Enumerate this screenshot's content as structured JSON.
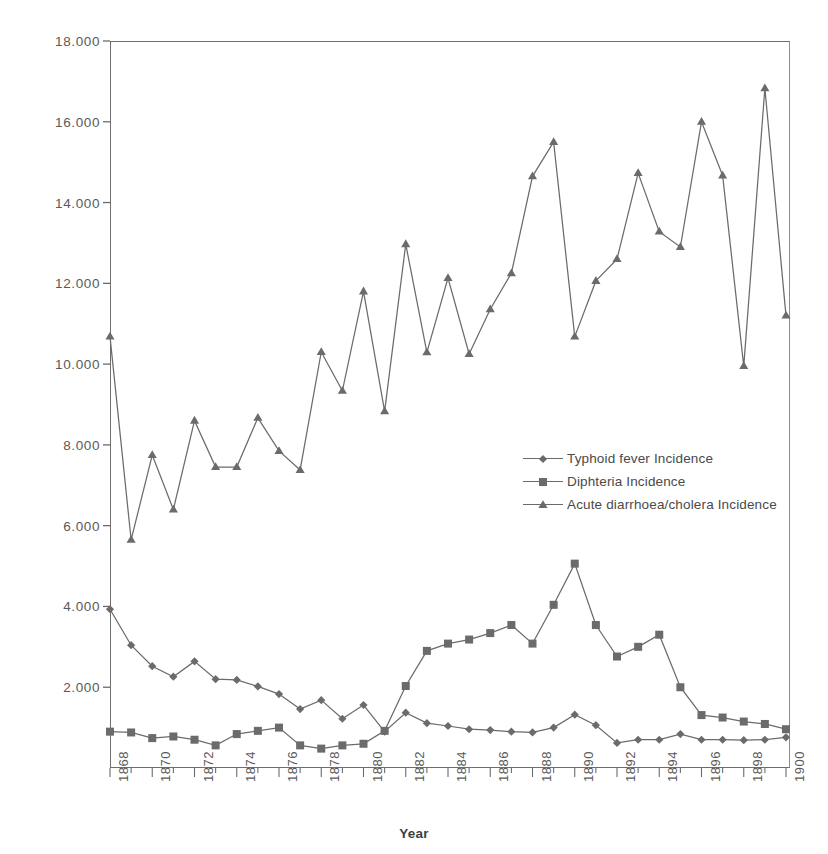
{
  "chart_data": {
    "type": "line",
    "title": "",
    "xlabel": "Year",
    "ylabel": "",
    "grid": false,
    "legend_position": "inside-center-right",
    "xlim": [
      1868,
      1900
    ],
    "ylim": [
      0,
      18000
    ],
    "y_tick_values": [
      18000,
      16000,
      14000,
      12000,
      10000,
      8000,
      6000,
      4000,
      2000
    ],
    "y_tick_labels": [
      "18.000",
      "16.000",
      "14.000",
      "12.000",
      "10.000",
      "8.000",
      "6.000",
      "4.000",
      "2.000"
    ],
    "x": [
      1868,
      1869,
      1870,
      1871,
      1872,
      1873,
      1874,
      1875,
      1876,
      1877,
      1878,
      1879,
      1880,
      1881,
      1882,
      1883,
      1884,
      1885,
      1886,
      1887,
      1888,
      1889,
      1890,
      1891,
      1892,
      1893,
      1894,
      1895,
      1896,
      1897,
      1898,
      1899,
      1900
    ],
    "x_tick_labels": [
      "1868",
      "",
      "1870",
      "",
      "1872",
      "",
      "1874",
      "",
      "1876",
      "",
      "1878",
      "",
      "1880",
      "",
      "1882",
      "",
      "1884",
      "",
      "1886",
      "",
      "1888",
      "",
      "1890",
      "",
      "1892",
      "",
      "1894",
      "",
      "1896",
      "",
      "1898",
      "",
      "1900"
    ],
    "series": [
      {
        "name": "Typhoid fever Incidence",
        "marker": "diamond",
        "color": "#6b6b6b",
        "values": [
          3930,
          3040,
          2520,
          2260,
          2640,
          2200,
          2180,
          2020,
          1830,
          1460,
          1680,
          1220,
          1560,
          900,
          1370,
          1110,
          1040,
          960,
          940,
          900,
          880,
          1000,
          1320,
          1060,
          620,
          700,
          700,
          840,
          700,
          700,
          690,
          700,
          760
        ]
      },
      {
        "name": "Diphteria Incidence",
        "marker": "square",
        "color": "#6b6b6b",
        "values": [
          900,
          880,
          740,
          780,
          700,
          560,
          840,
          920,
          1000,
          560,
          480,
          560,
          600,
          920,
          2030,
          2900,
          3080,
          3180,
          3340,
          3540,
          3080,
          4040,
          5060,
          3540,
          2760,
          3000,
          3300,
          2000,
          1310,
          1250,
          1150,
          1090,
          960
        ]
      },
      {
        "name": "Acute diarrhoea/cholera Incidence",
        "marker": "triangle",
        "color": "#6b6b6b",
        "values": [
          10680,
          5650,
          7750,
          6400,
          8600,
          7450,
          7450,
          8670,
          7850,
          7380,
          10300,
          9340,
          11800,
          8830,
          12970,
          10290,
          12130,
          10250,
          11360,
          12250,
          14650,
          15500,
          10680,
          12060,
          12600,
          14730,
          13280,
          12900,
          16000,
          14670,
          9950,
          16830,
          11200
        ]
      }
    ]
  },
  "legend": {
    "items": [
      {
        "label": "Typhoid fever Incidence",
        "marker": "diamond"
      },
      {
        "label": "Diphteria Incidence",
        "marker": "square"
      },
      {
        "label": "Acute diarrhoea/cholera Incidence",
        "marker": "triangle"
      }
    ]
  },
  "axis": {
    "x_title": "Year"
  }
}
